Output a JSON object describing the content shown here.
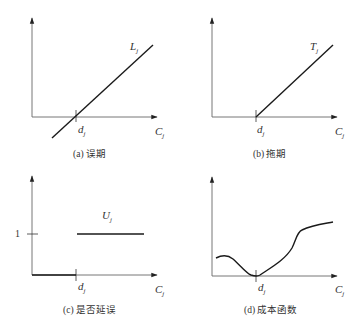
{
  "panels": [
    {
      "id": "a",
      "caption": "(a) 误期",
      "curve_label": "L",
      "curve_label_sub": "j",
      "due_label": "d",
      "due_label_sub": "j",
      "x_axis_label": "C",
      "x_axis_label_sub": "j",
      "description": "Lateness L_j = C_j - d_j, linear through d_j"
    },
    {
      "id": "b",
      "caption": "(b) 拖期",
      "curve_label": "T",
      "curve_label_sub": "j",
      "due_label": "d",
      "due_label_sub": "j",
      "x_axis_label": "C",
      "x_axis_label_sub": "j",
      "description": "Tardiness T_j = max(0, C_j - d_j)"
    },
    {
      "id": "c",
      "caption": "(c) 是否延误",
      "curve_label": "U",
      "curve_label_sub": "j",
      "due_label": "d",
      "due_label_sub": "j",
      "x_axis_label": "C",
      "x_axis_label_sub": "j",
      "y_tick_label": "1",
      "description": "Unit penalty U_j: 0 before d_j, 1 after"
    },
    {
      "id": "d",
      "caption": "(d) 成本函数",
      "due_label": "d",
      "due_label_sub": "j",
      "x_axis_label": "C",
      "x_axis_label_sub": "j",
      "description": "General cost function with minimum at d_j"
    }
  ],
  "colors": {
    "line": "#1a1a1a",
    "axis": "#555555",
    "text": "#333333"
  }
}
